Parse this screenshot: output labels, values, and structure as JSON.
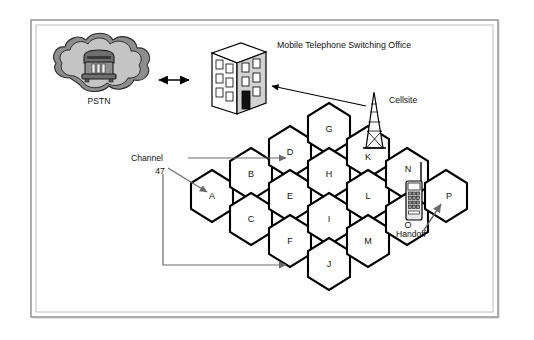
{
  "figure": {
    "type": "cellular-network-diagram",
    "background_color": "#ffffff",
    "frame_color": "#9a9a9a",
    "ink_color": "#000000",
    "cell_fill": "#ffffff",
    "cloud_fill": "#c8c8c8",
    "building_fill": "#d6d6d6"
  },
  "labels": {
    "pstn": "PSTN",
    "mtso": "Mobile Telephone Switching Office",
    "cellsite": "Cellsite",
    "channel": "Channel",
    "channel_number": "47",
    "handoff": "Handoff"
  },
  "cells": [
    {
      "id": "A",
      "label": "A",
      "cx": 212,
      "cy": 196
    },
    {
      "id": "B",
      "label": "B",
      "cx": 251,
      "cy": 174
    },
    {
      "id": "C",
      "label": "C",
      "cx": 251,
      "cy": 219
    },
    {
      "id": "D",
      "label": "D",
      "cx": 290,
      "cy": 152
    },
    {
      "id": "E",
      "label": "E",
      "cx": 290,
      "cy": 196
    },
    {
      "id": "F",
      "label": "F",
      "cx": 290,
      "cy": 241
    },
    {
      "id": "G",
      "label": "G",
      "cx": 329,
      "cy": 129
    },
    {
      "id": "H",
      "label": "H",
      "cx": 329,
      "cy": 174
    },
    {
      "id": "I",
      "label": "I",
      "cx": 329,
      "cy": 219
    },
    {
      "id": "J",
      "label": "J",
      "cx": 329,
      "cy": 264
    },
    {
      "id": "K",
      "label": "K",
      "cx": 368,
      "cy": 152
    },
    {
      "id": "L",
      "label": "L",
      "cx": 368,
      "cy": 196
    },
    {
      "id": "M",
      "label": "M",
      "cx": 368,
      "cy": 241
    },
    {
      "id": "N",
      "label": "N",
      "cx": 407,
      "cy": 174
    },
    {
      "id": "O",
      "label": "O",
      "cx": 407,
      "cy": 219
    },
    {
      "id": "P",
      "label": "P",
      "cx": 446,
      "cy": 196
    }
  ],
  "connections": [
    {
      "from": "pstn",
      "to": "mtso",
      "style": "double-arrow"
    },
    {
      "from": "mtso",
      "to": "cellsite",
      "style": "arrow"
    },
    {
      "from": "channel",
      "to": "D",
      "style": "arrow"
    },
    {
      "from": "channel_number",
      "to": "A",
      "style": "arrow"
    },
    {
      "from": "channel",
      "to": "F",
      "style": "arrow"
    },
    {
      "from": "handset",
      "to": "P",
      "style": "arrow",
      "label": "Handoff"
    }
  ],
  "icons": {
    "pstn": "cloud-telephone-icon",
    "mtso": "office-building-icon",
    "cellsite": "radio-tower-icon",
    "handset": "mobile-phone-icon"
  }
}
